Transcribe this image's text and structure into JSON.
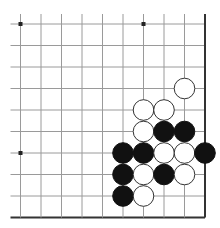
{
  "board": {
    "description": "Partial view of the lower-right quadrant of a 19x19 Go board",
    "visible_cols": 10,
    "visible_rows": 10,
    "origin_x": 20.5,
    "origin_y": 24,
    "step_x": 20.5,
    "step_y": 21.5,
    "edges": {
      "right": true,
      "bottom": true,
      "left": false,
      "top": false
    },
    "line_color": "#9a9a9a",
    "edge_color": "#333333",
    "stone_radius": 10.3,
    "black_color": "#111111",
    "white_color": "#ffffff",
    "white_outline": "#333333",
    "star_points": [
      {
        "col": 0,
        "row": 0
      },
      {
        "col": 6,
        "row": 0
      },
      {
        "col": 0,
        "row": 6
      }
    ],
    "stones": [
      {
        "col": 8,
        "row": 3,
        "color": "white"
      },
      {
        "col": 6,
        "row": 4,
        "color": "white"
      },
      {
        "col": 7,
        "row": 4,
        "color": "white"
      },
      {
        "col": 6,
        "row": 5,
        "color": "white"
      },
      {
        "col": 7,
        "row": 5,
        "color": "black"
      },
      {
        "col": 8,
        "row": 5,
        "color": "black"
      },
      {
        "col": 5,
        "row": 6,
        "color": "black"
      },
      {
        "col": 6,
        "row": 6,
        "color": "black"
      },
      {
        "col": 7,
        "row": 6,
        "color": "white"
      },
      {
        "col": 8,
        "row": 6,
        "color": "white"
      },
      {
        "col": 9,
        "row": 6,
        "color": "black"
      },
      {
        "col": 5,
        "row": 7,
        "color": "black"
      },
      {
        "col": 6,
        "row": 7,
        "color": "white"
      },
      {
        "col": 7,
        "row": 7,
        "color": "black"
      },
      {
        "col": 8,
        "row": 7,
        "color": "white"
      },
      {
        "col": 5,
        "row": 8,
        "color": "black"
      },
      {
        "col": 6,
        "row": 8,
        "color": "white"
      }
    ]
  }
}
